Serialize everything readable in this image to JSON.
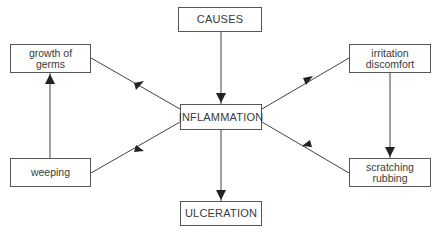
{
  "diagram": {
    "nodes": [
      {
        "id": "causes",
        "label": "CAUSES",
        "x": 178,
        "y": 7,
        "w": 84,
        "h": 25
      },
      {
        "id": "inflammation",
        "label": "INFLAMMATION",
        "x": 180,
        "y": 104,
        "w": 82,
        "h": 26
      },
      {
        "id": "ulceration",
        "label": "ULCERATION",
        "x": 180,
        "y": 201,
        "w": 82,
        "h": 25
      },
      {
        "id": "growth",
        "label": "growth of\ngerms",
        "x": 10,
        "y": 44,
        "w": 81,
        "h": 29
      },
      {
        "id": "weeping",
        "label": "weeping",
        "x": 10,
        "y": 158,
        "w": 81,
        "h": 29
      },
      {
        "id": "irritation",
        "label": "irritation\ndiscomfort",
        "x": 349,
        "y": 44,
        "w": 82,
        "h": 29
      },
      {
        "id": "scratching",
        "label": "scratching\nrubbing",
        "x": 349,
        "y": 158,
        "w": 82,
        "h": 29
      }
    ],
    "edges": [
      {
        "from": "causes",
        "to": "inflammation"
      },
      {
        "from": "inflammation",
        "to": "ulceration"
      },
      {
        "from": "growth",
        "to": "inflammation"
      },
      {
        "from": "inflammation",
        "to": "weeping"
      },
      {
        "from": "inflammation",
        "to": "irritation"
      },
      {
        "from": "scratching",
        "to": "inflammation"
      },
      {
        "from": "irritation",
        "to": "scratching"
      },
      {
        "from": "weeping",
        "to": "growth"
      }
    ],
    "line_color": "#444444"
  }
}
